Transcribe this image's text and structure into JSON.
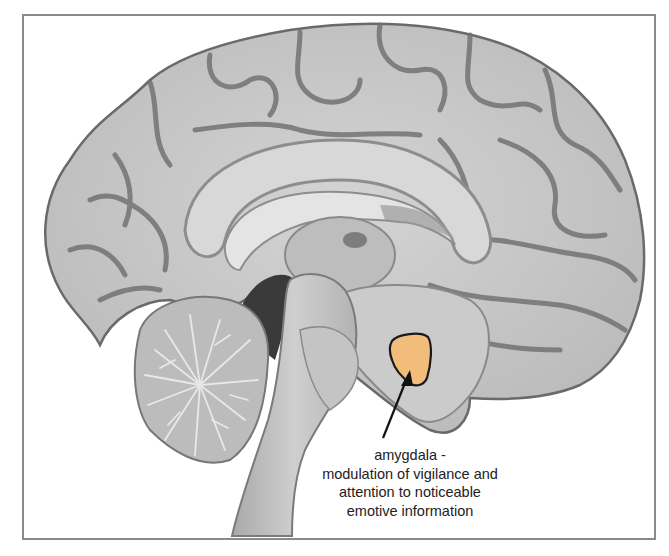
{
  "figure": {
    "highlight": {
      "structure": "amygdala",
      "color": "#f2bd7a",
      "outline_color": "#1a1a1a"
    },
    "label": {
      "lines": [
        "amygdala -",
        "modulation of vigilance and",
        "attention to noticeable",
        "emotive information"
      ]
    },
    "colors": {
      "tissue": "#c9c9c9",
      "sulcus": "#6f6f6f",
      "frame": "#8a8a8a",
      "background": "#ffffff"
    }
  }
}
